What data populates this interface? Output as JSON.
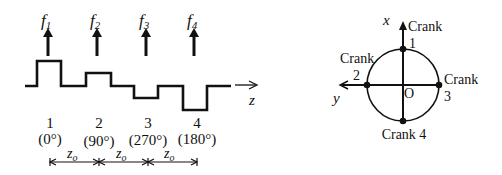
{
  "left_panel": {
    "forces": [
      {
        "label": "f",
        "sub": "1",
        "x": 48
      },
      {
        "label": "f",
        "sub": "2",
        "x": 97
      },
      {
        "label": "f",
        "sub": "3",
        "x": 146
      },
      {
        "label": "f",
        "sub": "4",
        "x": 194
      }
    ],
    "axis_label": "z",
    "stations": [
      {
        "number": "1",
        "angle": "(0°)",
        "x": 50
      },
      {
        "number": "2",
        "angle": "(90°)",
        "x": 99
      },
      {
        "number": "3",
        "angle": "(270°)",
        "x": 148
      },
      {
        "number": "4",
        "angle": "(180°)",
        "x": 197
      }
    ],
    "spacing": [
      {
        "label": "z",
        "sub": "o"
      },
      {
        "label": "z",
        "sub": "o"
      },
      {
        "label": "z",
        "sub": "o"
      }
    ]
  },
  "right_panel": {
    "axis_x_label": "x",
    "axis_y_label": "y",
    "origin_label": "O",
    "cranks": {
      "crank1_word": "Crank",
      "crank1_num": "1",
      "crank2_word": "Crank",
      "crank2_num": "2",
      "crank3_word": "Crank",
      "crank3_num": "3",
      "crank4_label": "Crank 4"
    }
  },
  "colors": {
    "ink": "#111111",
    "background": "#ffffff"
  }
}
